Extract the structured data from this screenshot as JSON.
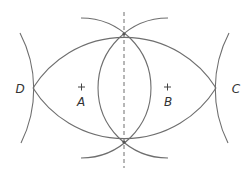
{
  "diagram": {
    "type": "geometric-construction",
    "colors": {
      "stroke": "#6e6e6e",
      "text": "#333333",
      "background": "#ffffff"
    },
    "points": {
      "A": {
        "label": "A",
        "x": 81,
        "y": 88,
        "marker": "plus"
      },
      "B": {
        "label": "B",
        "x": 168,
        "y": 88,
        "marker": "plus"
      },
      "C": {
        "label": "C",
        "x": 216,
        "y": 88,
        "marker": "intersection"
      },
      "D": {
        "label": "D",
        "x": 33,
        "y": 88,
        "marker": "intersection"
      },
      "top_intersection": {
        "x": 124,
        "y": 34
      },
      "bottom_intersection": {
        "x": 124,
        "y": 142
      }
    },
    "labels": {
      "A": "A",
      "B": "B",
      "C": "C",
      "D": "D"
    },
    "circles": [
      {
        "center": "A",
        "radius": 70,
        "visible": "right half"
      },
      {
        "center": "B",
        "radius": 70,
        "visible": "left half"
      },
      {
        "center": "bottom_intersection",
        "radius": 108,
        "visible": "upper arc D to C"
      },
      {
        "center": "top_intersection",
        "radius": 108,
        "visible": "lower arc D to C"
      },
      {
        "center": "off-canvas left",
        "radius": 121,
        "visible": "arc through D"
      },
      {
        "center": "off-canvas right",
        "radius": 121,
        "visible": "arc through C"
      }
    ],
    "bisector": {
      "style": "dashed",
      "x": 124,
      "y_start": 12,
      "y_end": 168
    }
  }
}
